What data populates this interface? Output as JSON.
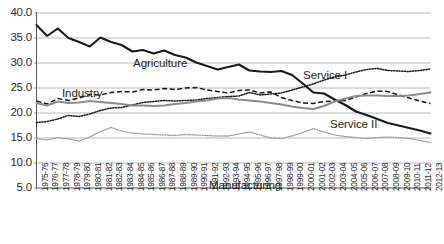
{
  "chart_data": {
    "type": "line",
    "title": "",
    "xlabel": "",
    "ylabel": "",
    "ylim": [
      5.0,
      40.0
    ],
    "ytick_labels": [
      "40.0",
      "35.0",
      "30.0",
      "25.0",
      "20.0",
      "15.0",
      "10.0",
      "5.0"
    ],
    "ytick_values": [
      40.0,
      35.0,
      30.0,
      25.0,
      20.0,
      15.0,
      10.0,
      5.0
    ],
    "grid": true,
    "legend_position": "inline-annotations",
    "categories": [
      "1975-76",
      "1976-77",
      "1977-78",
      "1978-79",
      "1979-80",
      "1980-81",
      "1981-82",
      "1982-83",
      "1983-84",
      "1984-85",
      "1985-86",
      "1986-87",
      "1987-88",
      "1988-89",
      "1989-90",
      "1990-91",
      "1991-92",
      "1992-93",
      "1993-94",
      "1994-95",
      "1995-96",
      "1996-97",
      "1997-98",
      "1998-99",
      "1999-00",
      "2000-01",
      "2001-02",
      "2002-03",
      "2003-04",
      "2004-05",
      "2005-06",
      "2006-07",
      "2007-08",
      "2008-09",
      "2009-10",
      "2010-11",
      "2011-12",
      "2012-13"
    ],
    "series": [
      {
        "name": "Agriculture",
        "style": "solid-thick-black",
        "color": "#1a1a1a",
        "values": [
          37.6,
          35.4,
          36.9,
          35.0,
          34.2,
          33.3,
          35.1,
          34.2,
          33.6,
          32.3,
          32.6,
          31.9,
          32.5,
          31.6,
          31.1,
          30.1,
          29.4,
          28.7,
          29.2,
          29.7,
          28.5,
          28.3,
          28.2,
          28.4,
          27.6,
          25.9,
          24.1,
          23.9,
          22.7,
          21.6,
          20.3,
          19.6,
          18.8,
          18.0,
          17.5,
          17.0,
          16.5,
          15.9
        ]
      },
      {
        "name": "Industry",
        "style": "dashed-black",
        "color": "#1a1a1a",
        "values": [
          22.4,
          21.8,
          22.9,
          22.5,
          23.0,
          23.7,
          23.6,
          24.1,
          24.3,
          24.2,
          24.7,
          24.6,
          24.9,
          24.7,
          25.0,
          25.1,
          24.6,
          24.3,
          24.0,
          24.5,
          24.6,
          24.0,
          24.2,
          23.1,
          22.5,
          22.0,
          21.9,
          22.3,
          22.4,
          22.5,
          23.2,
          23.9,
          24.4,
          24.3,
          23.6,
          23.0,
          22.4,
          21.9
        ]
      },
      {
        "name": "Service I",
        "style": "dotted-black",
        "color": "#1a1a1a",
        "values": [
          18.1,
          18.3,
          18.8,
          19.5,
          19.3,
          19.8,
          20.5,
          21.0,
          21.1,
          21.6,
          22.1,
          22.3,
          22.5,
          22.4,
          22.5,
          22.6,
          22.9,
          23.1,
          23.3,
          23.4,
          24.1,
          23.6,
          23.8,
          24.0,
          24.6,
          25.2,
          25.8,
          26.6,
          27.2,
          27.6,
          28.2,
          28.7,
          28.9,
          28.5,
          28.4,
          28.3,
          28.5,
          28.8
        ]
      },
      {
        "name": "Service II",
        "style": "solid-gray",
        "color": "#8c8c8c",
        "values": [
          22.0,
          21.5,
          22.3,
          22.0,
          22.1,
          22.4,
          22.2,
          22.0,
          21.8,
          21.5,
          21.5,
          21.4,
          21.5,
          21.8,
          22.0,
          22.3,
          22.5,
          22.9,
          23.0,
          22.7,
          22.5,
          22.3,
          22.0,
          21.7,
          21.3,
          21.0,
          20.8,
          21.4,
          22.3,
          22.9,
          23.4,
          23.5,
          23.5,
          23.4,
          23.4,
          23.5,
          23.8,
          24.1
        ]
      },
      {
        "name": "Manufacturing",
        "style": "dotted-gray",
        "color": "#9a9a9a",
        "values": [
          14.9,
          14.6,
          15.1,
          14.8,
          14.4,
          15.2,
          16.3,
          17.1,
          16.4,
          16.0,
          15.8,
          15.7,
          15.6,
          15.5,
          15.7,
          15.6,
          15.5,
          15.4,
          15.4,
          15.8,
          16.2,
          15.6,
          15.0,
          14.9,
          15.4,
          16.1,
          16.9,
          16.2,
          15.6,
          15.3,
          15.1,
          14.9,
          15.1,
          15.2,
          15.1,
          14.9,
          14.5,
          14.1
        ]
      }
    ],
    "annotations": [
      {
        "text": "Agriculture",
        "x_px": 133,
        "y_px": 56
      },
      {
        "text": "Industry",
        "x_px": 62,
        "y_px": 86
      },
      {
        "text": "Service I",
        "x_px": 303,
        "y_px": 68
      },
      {
        "text": "Service II",
        "x_px": 330,
        "y_px": 117
      },
      {
        "text": "Manufacturing",
        "x_px": 209,
        "y_px": 178
      }
    ]
  }
}
